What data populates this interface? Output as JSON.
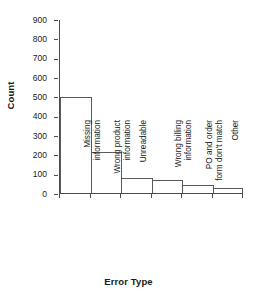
{
  "chart_data": {
    "type": "bar",
    "title": "",
    "xlabel": "Error Type",
    "ylabel": "Count",
    "categories": [
      "Missing information",
      "Wrong product information",
      "Unreadable",
      "Wrong billing information",
      "PO and order form don't match",
      "Other"
    ],
    "category_lines": [
      [
        "Missing",
        "information"
      ],
      [
        "Wrong product",
        "information"
      ],
      [
        "Unreadable"
      ],
      [
        "Wrong billing",
        "information"
      ],
      [
        "PO and order",
        "form don't match"
      ],
      [
        "Other"
      ]
    ],
    "values": [
      500,
      212,
      78,
      68,
      42,
      26
    ],
    "ylim": [
      0,
      900
    ],
    "ytick_values": [
      0,
      100,
      200,
      300,
      400,
      500,
      600,
      700,
      800,
      900
    ],
    "ytick_labels": [
      "0",
      "100",
      "200",
      "300",
      "400",
      "500",
      "600",
      "700",
      "800",
      "900"
    ],
    "grid": false,
    "legend": false,
    "legend_position": "none",
    "bar_gap": 0,
    "colors": {
      "bar_fill": "#ffffff",
      "bar_edge": "#5a5a5a",
      "axis": "#4d4d4d",
      "text": "#1a1a1a",
      "background": "#ffffff"
    }
  }
}
